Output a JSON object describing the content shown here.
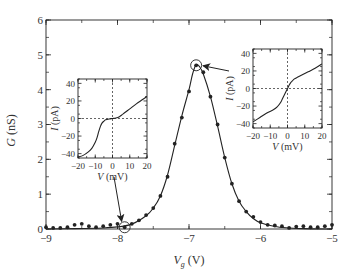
{
  "chart_data": {
    "type": "scatter",
    "title": "",
    "xlabel": "V_g (V)",
    "xlabel_main": "V",
    "xlabel_sub": "g",
    "xlabel_unit": "(V)",
    "ylabel": "G (nS)",
    "ylabel_main": "G",
    "ylabel_unit": "(nS)",
    "xlim": [
      -9,
      -5
    ],
    "ylim": [
      0,
      6
    ],
    "xticks": [
      -9,
      -8,
      -7,
      -6,
      -5
    ],
    "xtick_labels": [
      "−9",
      "−8",
      "−7",
      "−6",
      "−5"
    ],
    "yticks": [
      0,
      1,
      2,
      3,
      4,
      5,
      6
    ],
    "ytick_labels": [
      "0",
      "1",
      "2",
      "3",
      "4",
      "5",
      "6"
    ],
    "grid": false,
    "legend": null,
    "series": [
      {
        "name": "measured G",
        "style": "markers",
        "x": [
          -9.0,
          -8.9,
          -8.8,
          -8.7,
          -8.6,
          -8.5,
          -8.4,
          -8.3,
          -8.2,
          -8.1,
          -8.0,
          -7.9,
          -7.8,
          -7.7,
          -7.6,
          -7.5,
          -7.4,
          -7.3,
          -7.2,
          -7.1,
          -7.0,
          -6.9,
          -6.8,
          -6.7,
          -6.6,
          -6.5,
          -6.4,
          -6.3,
          -6.2,
          -6.1,
          -6.0,
          -5.9,
          -5.8,
          -5.7,
          -5.6,
          -5.5,
          -5.4,
          -5.3,
          -5.2,
          -5.1,
          -5.0
        ],
        "y": [
          0.05,
          0.03,
          0.03,
          0.05,
          0.12,
          0.15,
          0.08,
          0.05,
          0.08,
          0.12,
          0.15,
          0.05,
          0.15,
          0.25,
          0.4,
          0.6,
          0.95,
          1.5,
          2.45,
          3.2,
          3.95,
          4.7,
          4.5,
          3.8,
          3.0,
          2.05,
          1.3,
          0.8,
          0.5,
          0.35,
          0.2,
          0.12,
          0.1,
          0.08,
          0.03,
          0.07,
          0.08,
          0.05,
          0.05,
          0.08,
          0.12
        ]
      },
      {
        "name": "Lorentzian fit",
        "style": "line",
        "x": [
          -9.0,
          -8.6,
          -8.2,
          -8.0,
          -7.8,
          -7.6,
          -7.5,
          -7.4,
          -7.3,
          -7.2,
          -7.1,
          -7.0,
          -6.95,
          -6.9,
          -6.85,
          -6.8,
          -6.7,
          -6.6,
          -6.5,
          -6.4,
          -6.3,
          -6.2,
          -6.1,
          -6.0,
          -5.8,
          -5.6,
          -5.4,
          -5.0
        ],
        "y": [
          0.0,
          0.01,
          0.03,
          0.06,
          0.14,
          0.38,
          0.6,
          0.95,
          1.55,
          2.4,
          3.25,
          4.0,
          4.45,
          4.72,
          4.65,
          4.45,
          3.8,
          2.95,
          2.05,
          1.3,
          0.8,
          0.5,
          0.3,
          0.18,
          0.07,
          0.03,
          0.01,
          0.0
        ]
      }
    ],
    "annotations": [
      {
        "type": "circle",
        "label": "valley point",
        "x": -7.9,
        "y": 0.05
      },
      {
        "type": "circle",
        "label": "peak point",
        "x": -6.9,
        "y": 4.7
      }
    ],
    "insets": [
      {
        "name": "I-V at valley (V_g ≈ −7.9 V)",
        "type": "line",
        "xlabel": "V (mV)",
        "xlabel_main": "V",
        "xlabel_unit": "(mV)",
        "ylabel": "I (pA)",
        "ylabel_main": "I",
        "ylabel_unit": "(pA)",
        "xlim": [
          -20,
          20
        ],
        "ylim": [
          -45,
          45
        ],
        "xticks": [
          -20,
          -10,
          0,
          10,
          20
        ],
        "xtick_labels": [
          "−20",
          "−10",
          "0",
          "10",
          "20"
        ],
        "yticks": [
          -40,
          -20,
          0,
          20,
          40
        ],
        "ytick_labels": [
          "−40",
          "−20",
          "0",
          "20",
          "40"
        ],
        "x": [
          -20,
          -17,
          -14,
          -12,
          -10,
          -9,
          -8,
          -7,
          -6,
          -5,
          -4,
          -2,
          0,
          2,
          4,
          6,
          8,
          10,
          14,
          17,
          20
        ],
        "y": [
          -44,
          -42,
          -38,
          -34,
          -27,
          -22,
          -15,
          -9,
          -5,
          -3,
          -1.5,
          -0.5,
          0,
          0.5,
          2,
          5,
          8,
          11,
          17,
          21,
          25
        ]
      },
      {
        "name": "I-V at peak (V_g ≈ −6.9 V)",
        "type": "line",
        "xlabel": "V (mV)",
        "xlabel_main": "V",
        "xlabel_unit": "(mV)",
        "ylabel": "I (pA)",
        "ylabel_main": "I",
        "ylabel_unit": "(pA)",
        "xlim": [
          -20,
          20
        ],
        "ylim": [
          -45,
          45
        ],
        "xticks": [
          -20,
          -10,
          0,
          10,
          20
        ],
        "xtick_labels": [
          "−20",
          "−10",
          "0",
          "10",
          "20"
        ],
        "yticks": [
          -40,
          -20,
          0,
          20,
          40
        ],
        "ytick_labels": [
          "−40",
          "−20",
          "0",
          "20",
          "40"
        ],
        "x": [
          -20,
          -16,
          -12,
          -8,
          -6,
          -4,
          -3,
          -2,
          -1,
          0,
          1,
          2,
          3,
          4,
          6,
          8,
          12,
          16,
          20
        ],
        "y": [
          -38,
          -33,
          -28,
          -24,
          -21,
          -16,
          -12,
          -8,
          -4,
          0,
          4,
          7,
          9,
          11,
          13,
          15,
          19,
          23,
          28
        ]
      }
    ]
  }
}
